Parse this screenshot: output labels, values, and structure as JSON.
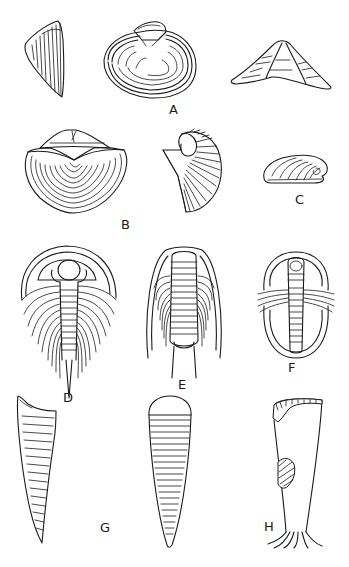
{
  "plate": {
    "background": "#ffffff",
    "ink_color": "#1a1a1a",
    "figures": [
      {
        "id": "A",
        "label": "A",
        "subject": "brachiopod shell (three views: side, dorsal, profile)"
      },
      {
        "id": "B",
        "label": "B",
        "subject": "brachiopod with concentric growth lines and fan-shaped valve"
      },
      {
        "id": "C",
        "label": "C",
        "subject": "coiled ribbed shell"
      },
      {
        "id": "D",
        "label": "D",
        "subject": "trilobite with long genal spines and tail spine"
      },
      {
        "id": "E",
        "label": "E",
        "subject": "trilobite with long genal and pygidial spines"
      },
      {
        "id": "F",
        "label": "F",
        "subject": "oval trilobite"
      },
      {
        "id": "G",
        "label": "G",
        "subject": "hyolith conical shells (two views)"
      },
      {
        "id": "H",
        "label": "H",
        "subject": "tubular fossil with holdfast roots"
      }
    ]
  }
}
